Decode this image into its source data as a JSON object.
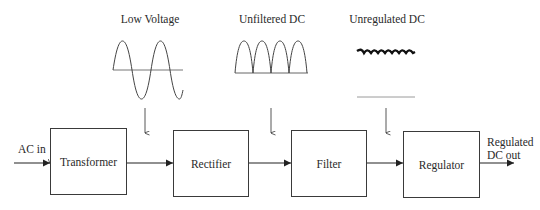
{
  "diagram": {
    "input_label": "AC in",
    "output_label_line1": "Regulated",
    "output_label_line2": "DC out",
    "blocks": [
      {
        "id": "transformer",
        "label": "Transformer"
      },
      {
        "id": "rectifier",
        "label": "Rectifier"
      },
      {
        "id": "filter",
        "label": "Filter"
      },
      {
        "id": "regulator",
        "label": "Regulator"
      }
    ],
    "waveforms": [
      {
        "id": "low-voltage",
        "label": "Low Voltage",
        "shape": "sine"
      },
      {
        "id": "unfiltered-dc",
        "label": "Unfiltered DC",
        "shape": "full-wave-rectified"
      },
      {
        "id": "unregulated-dc",
        "label": "Unregulated DC",
        "shape": "ripple"
      },
      {
        "id": "regulated-dc",
        "label": "",
        "shape": "flat-line"
      }
    ],
    "colors": {
      "line": "#3a3a3a",
      "flat_line": "#9a9a9a",
      "background": "#ffffff"
    }
  }
}
